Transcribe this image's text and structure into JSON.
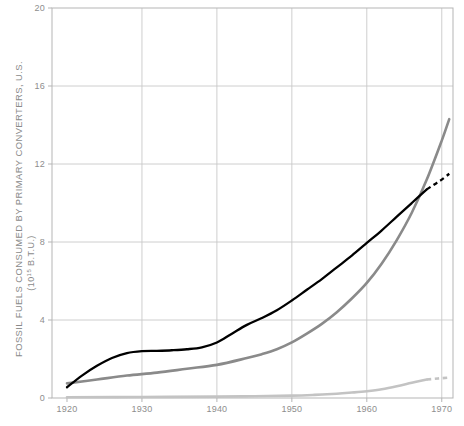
{
  "chart_data": {
    "type": "line",
    "title": "",
    "xlabel": "",
    "ylabel": "FOSSIL FUELS CONSUMED BY PRIMARY CONVERTERS, U.S.",
    "ylabel_units_prefix": "(10",
    "ylabel_units_exponent": "15",
    "ylabel_units_suffix": " B.T.U.)",
    "xlim": [
      1918,
      1971.5
    ],
    "ylim": [
      0,
      20
    ],
    "xticks": [
      1920,
      1930,
      1940,
      1950,
      1960,
      1970
    ],
    "xticklabels": [
      "1920",
      "1930",
      "1940",
      "1950",
      "1960",
      "1970"
    ],
    "yticks": [
      0,
      4,
      8,
      12,
      16,
      20
    ],
    "yticklabels": [
      "0",
      "4",
      "8",
      "12",
      "16",
      "20"
    ],
    "grid": true,
    "grid_color": "#c8c8c8",
    "legend": "none",
    "series": [
      {
        "name": "black-curve",
        "color": "#000000",
        "width": 2.3,
        "solid_x": [
          1920,
          1922,
          1924,
          1926,
          1928,
          1930,
          1932,
          1934,
          1936,
          1938,
          1940,
          1942,
          1944,
          1946,
          1948,
          1950,
          1952,
          1954,
          1956,
          1958,
          1960,
          1962,
          1964,
          1966,
          1968
        ],
        "solid_y": [
          0.55,
          1.15,
          1.65,
          2.05,
          2.3,
          2.4,
          2.42,
          2.45,
          2.5,
          2.6,
          2.85,
          3.3,
          3.75,
          4.1,
          4.5,
          5.0,
          5.55,
          6.1,
          6.7,
          7.3,
          7.95,
          8.6,
          9.3,
          10.0,
          10.7
        ],
        "dashed_x": [
          1968,
          1969,
          1970,
          1971
        ],
        "dashed_y": [
          10.7,
          10.95,
          11.2,
          11.5
        ]
      },
      {
        "name": "medium-gray-curve",
        "color": "#8a8a8a",
        "width": 2.6,
        "solid_x": [
          1920,
          1924,
          1928,
          1932,
          1936,
          1940,
          1944,
          1946,
          1948,
          1950,
          1952,
          1954,
          1956,
          1958,
          1960,
          1962,
          1964,
          1966,
          1968,
          1970,
          1971
        ],
        "solid_y": [
          0.75,
          0.95,
          1.15,
          1.3,
          1.5,
          1.7,
          2.05,
          2.25,
          2.5,
          2.85,
          3.3,
          3.8,
          4.4,
          5.1,
          5.9,
          6.9,
          8.1,
          9.5,
          11.2,
          13.2,
          14.3
        ],
        "dashed_x": [],
        "dashed_y": []
      },
      {
        "name": "light-gray-curve",
        "color": "#c3c3c3",
        "width": 2.6,
        "solid_x": [
          1920,
          1930,
          1940,
          1945,
          1950,
          1953,
          1956,
          1958,
          1960,
          1962,
          1964,
          1966,
          1968
        ],
        "solid_y": [
          0.04,
          0.05,
          0.07,
          0.09,
          0.12,
          0.16,
          0.22,
          0.28,
          0.35,
          0.45,
          0.6,
          0.78,
          0.95
        ],
        "dashed_x": [
          1968,
          1969.5,
          1971
        ],
        "dashed_y": [
          0.95,
          1.0,
          1.05
        ]
      }
    ]
  },
  "plot_geometry": {
    "left": 52,
    "right": 453,
    "top": 8,
    "bottom": 398
  },
  "axis_style": {
    "frame_color": "#b5b5b5",
    "tick_label_color": "#8e8e8e",
    "label_color": "#8a8a8a"
  }
}
